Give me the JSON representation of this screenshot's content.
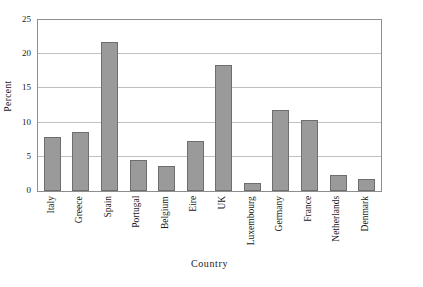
{
  "chart_data": {
    "type": "bar",
    "title": "",
    "xlabel": "Country",
    "ylabel": "Percent",
    "categories": [
      "Italy",
      "Greece",
      "Spain",
      "Portugal",
      "Belgium",
      "Eire",
      "UK",
      "Luxembourg",
      "Germany",
      "France",
      "Netherlands",
      "Denmark"
    ],
    "values": [
      7.9,
      8.6,
      21.8,
      4.5,
      3.6,
      7.3,
      18.4,
      1.1,
      11.8,
      10.4,
      2.4,
      1.8
    ],
    "ylim": [
      0,
      25
    ],
    "yticks": [
      0,
      5,
      10,
      15,
      20,
      25
    ],
    "ytick_labels": [
      "0",
      "5",
      "10",
      "15",
      "20",
      "25"
    ],
    "grid": "horizontal",
    "legend": "none",
    "bar_color": "#9a9a9a",
    "bar_edge_color": "#6e6e6e",
    "grid_color": "#c0c0c0",
    "frame_color": "#8e8e8e",
    "background": "#ffffff",
    "xtick_rotation": 90
  }
}
